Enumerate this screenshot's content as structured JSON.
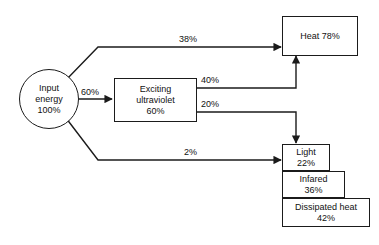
{
  "diagram": {
    "type": "flow-diagram",
    "stroke_color": "#1b1b1b",
    "background_color": "#ffffff",
    "text_color": "#111111",
    "nodes": [
      {
        "id": "input-energy",
        "shape": "circle",
        "line1": "Input",
        "line2": "energy",
        "line3": "100%",
        "value": 100,
        "unit": "%"
      },
      {
        "id": "exciting-ultraviolet",
        "shape": "rect",
        "line1": "Exciting",
        "line2": "ultraviolet",
        "line3": "60%",
        "value": 60,
        "unit": "%"
      },
      {
        "id": "heat",
        "shape": "rect",
        "line1": "Heat 78%",
        "value": 78,
        "unit": "%"
      },
      {
        "id": "light",
        "shape": "rect",
        "line1": "Light",
        "line2": "22%",
        "value": 22,
        "unit": "%"
      },
      {
        "id": "infared",
        "shape": "rect",
        "line1": "Infared",
        "line2": "36%",
        "value": 36,
        "unit": "%"
      },
      {
        "id": "dissipated-heat",
        "shape": "rect",
        "line1": "Dissipated heat",
        "line2": "42%",
        "value": 42,
        "unit": "%"
      }
    ],
    "edges": [
      {
        "id": "input-to-heat",
        "label": "38%",
        "value": 38,
        "from": "input-energy",
        "to": "heat"
      },
      {
        "id": "input-to-uv",
        "label": "60%",
        "value": 60,
        "from": "input-energy",
        "to": "exciting-ultraviolet"
      },
      {
        "id": "input-to-light",
        "label": "2%",
        "value": 2,
        "from": "input-energy",
        "to": "light"
      },
      {
        "id": "uv-to-heat",
        "label": "40%",
        "value": 40,
        "from": "exciting-ultraviolet",
        "to": "heat"
      },
      {
        "id": "uv-to-light",
        "label": "20%",
        "value": 20,
        "from": "exciting-ultraviolet",
        "to": "light"
      }
    ]
  }
}
